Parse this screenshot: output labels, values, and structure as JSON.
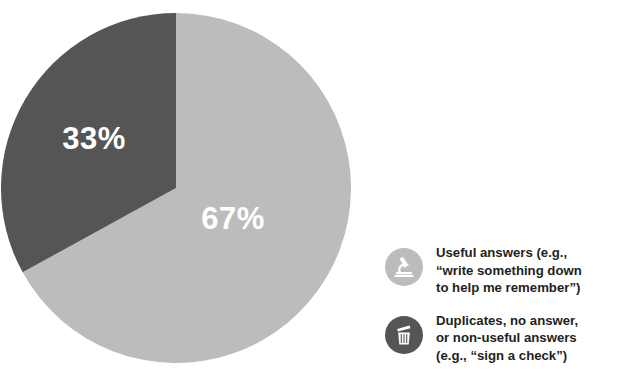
{
  "chart_data": {
    "type": "pie",
    "title": "",
    "subtitle": "",
    "xlabel": "",
    "ylabel": "",
    "legend_position": "right",
    "grid": false,
    "start_angle_deg": 0,
    "direction": "clockwise",
    "categories": [
      "Useful answers (e.g., \"write something down to help me remember\")",
      "Duplicates, no answer, or non-useful answers (e.g., \"sign a check\")"
    ],
    "values": [
      67,
      33
    ],
    "value_labels": [
      "67%",
      "33%"
    ],
    "colors": [
      "#bcbcbc",
      "#555555"
    ],
    "annotations": []
  },
  "pie": {
    "slices": [
      {
        "id": "useful",
        "percent_label": "67%",
        "value": 67,
        "color": "#bcbcbc",
        "label_x": 232,
        "label_y": 208
      },
      {
        "id": "non-useful",
        "percent_label": "33%",
        "value": 33,
        "color": "#555555",
        "label_x": 93,
        "label_y": 128
      }
    ]
  },
  "legend": {
    "items": [
      {
        "icon": "microscope-icon",
        "icon_bg": "#bcbcbc",
        "icon_fg": "#ffffff",
        "text": "Useful answers (e.g.,\n“write something down\nto help me remember”)"
      },
      {
        "icon": "trash-icon",
        "icon_bg": "#555555",
        "icon_fg": "#ffffff",
        "text": "Duplicates, no answer,\nor non-useful answers\n(e.g., “sign a check”)"
      }
    ]
  },
  "colors": {
    "background": "#ffffff",
    "light_gray": "#bcbcbc",
    "dark_gray": "#555555",
    "text": "#231f20",
    "label_text": "#ffffff"
  }
}
